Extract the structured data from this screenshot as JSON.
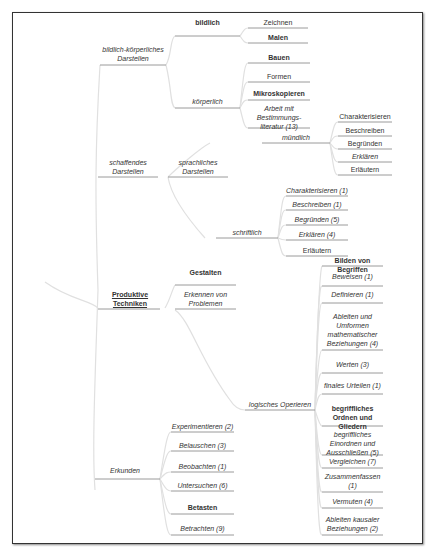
{
  "root": "Produktive Techniken",
  "branches": {
    "bildlich_koerperlich": {
      "label": "bildlich-körperliches Darstellen",
      "bildlich": {
        "label": "bildlich",
        "items": [
          "Zeichnen",
          "Malen"
        ]
      },
      "koerperlich": {
        "label": "körperlich",
        "items": [
          "Bauen",
          "Formen",
          "Mikroskopieren",
          "Arbeit mit Bestimmungs-literatur (13)"
        ]
      }
    },
    "schaffendes": {
      "label": "schaffendes Darstellen",
      "sprachliches": {
        "label": "sprachliches Darstellen",
        "muendlich": {
          "label": "mündlich",
          "items": [
            "Charakterisieren",
            "Beschreiben",
            "Begründen",
            "Erklären",
            "Erläutern"
          ]
        },
        "schriftlich": {
          "label": "schriftlich",
          "items": [
            "Charakterisieren (1)",
            "Beschreiben (1)",
            "Begründen (5)",
            "Erklären (4)",
            "Erläutern"
          ]
        }
      }
    },
    "gestalten": {
      "label": "Gestalten"
    },
    "erkennen": {
      "label": "Erkennen von Problemen"
    },
    "logisches": {
      "label": "logisches Operieren",
      "items": [
        "Bilden von Begriffen",
        "Beweisen (1)",
        "Definieren (1)",
        "Ableiten und Umformen mathematischer Beziehungen (4)",
        "Werten (3)",
        "finales Urteilen (1)",
        "begriffliches Ordnen und Gliedern",
        "begriffliches Einordnen und Ausschließen (5)",
        "Vergleichen (7)",
        "Zusammenfassen (1)",
        "Vermuten (4)",
        "Ableiten kausaler Beziehungen (2)"
      ]
    },
    "erkunden": {
      "label": "Erkunden",
      "items": [
        "Experimentieren (2)",
        "Belauschen (3)",
        "Beobachten (1)",
        "Untersuchen (6)",
        "Betasten",
        "Betrachten (9)"
      ]
    }
  },
  "colors": {
    "line": "#9a9a9a",
    "branch": "#d8d8d8",
    "frame": "#333333",
    "text": "#333333"
  }
}
